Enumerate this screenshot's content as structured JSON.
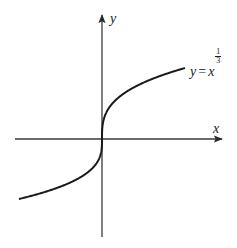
{
  "chart_data": {
    "type": "line",
    "title": "",
    "function": "y = x^(1/3)",
    "xlabel": "x",
    "ylabel": "y",
    "curve_label": {
      "lhs": "y",
      "equals": "=",
      "base": "x",
      "exponent_numerator": "1",
      "exponent_denominator": "3"
    },
    "xlim": [
      -8,
      8
    ],
    "ylim": [
      -2,
      2
    ],
    "grid": false,
    "legend": "none",
    "ticks": "none",
    "series": [
      {
        "name": "y = x^(1/3)",
        "x": [
          -8,
          -6,
          -4,
          -2,
          -1,
          -0.5,
          -0.125,
          0,
          0.125,
          0.5,
          1,
          2,
          4,
          6,
          8
        ],
        "values": [
          -2,
          -1.817,
          -1.587,
          -1.26,
          -1,
          -0.794,
          -0.5,
          0,
          0.5,
          0.794,
          1,
          1.26,
          1.587,
          1.817,
          2
        ]
      }
    ],
    "colors": {
      "curve": "#1a1a1a",
      "axes": "#3a3a3a",
      "background": "#ffffff"
    }
  }
}
